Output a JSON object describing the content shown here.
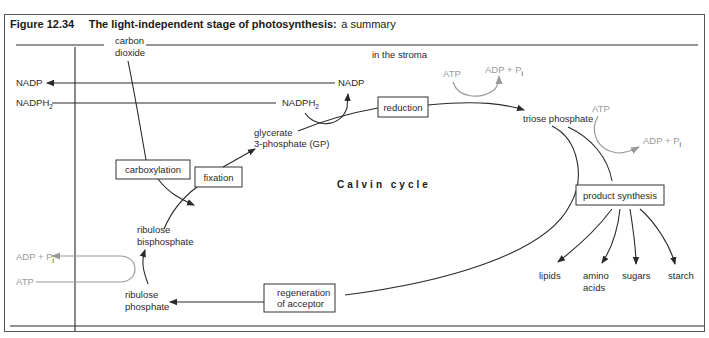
{
  "figure": {
    "number": "Figure 12.34",
    "title_bold": "The light-independent stage of photosynthesis:",
    "title_rest": " a summary"
  },
  "location_label": "in the stroma",
  "cycle_label": "Calvin cycle",
  "inputs": {
    "carbon_dioxide": [
      "carbon",
      "dioxide"
    ],
    "nadp_out": "NADP",
    "nadph2_in": "NADPH",
    "nadph2_sub": "2",
    "adp_pi_out": "ADP + P",
    "pi_sub": "i",
    "atp_in": "ATP"
  },
  "reduction_step": {
    "nadp": "NADP",
    "nadph2": "NADPH",
    "nadph2_sub": "2",
    "atp": "ATP",
    "adp_pi": "ADP + P",
    "pi_sub": "i"
  },
  "product_step": {
    "atp": "ATP",
    "adp_pi": "ADP + P",
    "pi_sub": "i"
  },
  "boxes": {
    "carboxylation": "carboxylation",
    "fixation": "fixation",
    "reduction": "reduction",
    "product_synthesis": "product synthesis",
    "regeneration": [
      "regeneration",
      "of acceptor"
    ]
  },
  "intermediates": {
    "glycerate": [
      "glycerate",
      "3-phosphate (GP)"
    ],
    "triose_phosphate": "triose phosphate",
    "ribulose_bisphosphate": [
      "ribulose",
      "bisphosphate"
    ],
    "ribulose_phosphate": [
      "ribulose",
      "phosphate"
    ]
  },
  "products": [
    {
      "label": [
        "lipids"
      ]
    },
    {
      "label": [
        "amino",
        "acids"
      ]
    },
    {
      "label": [
        "sugars"
      ]
    },
    {
      "label": [
        "starch"
      ]
    }
  ],
  "colors": {
    "line": "#2a2a2a",
    "grey_energy": "#9a9a9a",
    "frame": "#555555"
  }
}
